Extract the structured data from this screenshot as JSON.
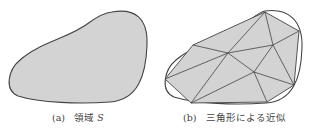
{
  "figures": [
    {
      "id": "a",
      "caption_label": "(a)",
      "caption_text": "領域",
      "caption_var": "S",
      "description": "smooth closed region S"
    },
    {
      "id": "b",
      "caption_label": "(b)",
      "caption_text": "三角形による近似",
      "description": "region approximated by triangles"
    }
  ],
  "colors": {
    "fill": "#d3d3d3",
    "stroke": "#444444",
    "background": "#ffffff"
  }
}
